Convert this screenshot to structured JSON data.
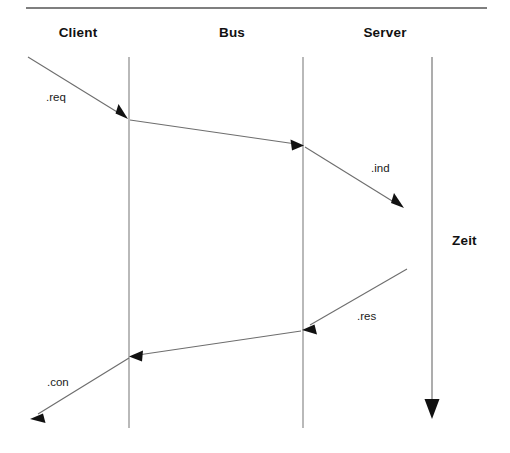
{
  "diagram": {
    "kind": "sequence-diagram",
    "width": 510,
    "height": 453,
    "background_color": "#ffffff",
    "line_color": "#6e6e6e",
    "arrow_color": "#1a1a1a",
    "text_color": "#111111",
    "rule": {
      "name": "top-rule",
      "x1": 26,
      "y1": 8,
      "x2": 487,
      "y2": 8,
      "color": "#555555"
    },
    "lanes": [
      {
        "id": "client",
        "label": "Client",
        "label_x": 78,
        "label_y": 25,
        "has_lifeline": false
      },
      {
        "id": "bus",
        "label": "Bus",
        "label_x": 232,
        "label_y": 25,
        "has_lifeline": true,
        "lifeline_x": 129,
        "lifeline_y1": 57,
        "lifeline_y2": 428
      },
      {
        "id": "server",
        "label": "Server",
        "label_x": 385,
        "label_y": 25,
        "has_lifeline": true,
        "lifeline_x": 303,
        "lifeline_y1": 57,
        "lifeline_y2": 428
      }
    ],
    "time_axis": {
      "label": "Zeit",
      "label_x": 452,
      "label_y": 233,
      "x": 432,
      "y1": 57,
      "y2": 418,
      "arrow_direction": "down"
    },
    "messages": [
      {
        "id": "req",
        "label": ".req",
        "label_x": 46,
        "label_y": 91,
        "from": "client",
        "to": "bus",
        "x1": 28,
        "y1": 57,
        "x2": 127,
        "y2": 118,
        "arrowhead": "end"
      },
      {
        "id": "bus-to-server",
        "label": "",
        "from": "bus",
        "to": "server",
        "x1": 130,
        "y1": 120,
        "x2": 301,
        "y2": 145,
        "arrowhead": "end"
      },
      {
        "id": "ind",
        "label": ".ind",
        "label_x": 371,
        "label_y": 162,
        "from": "server",
        "to": "server-end",
        "x1": 305,
        "y1": 147,
        "x2": 402,
        "y2": 207,
        "arrowhead": "end"
      },
      {
        "id": "res",
        "label": ".res",
        "label_x": 357,
        "label_y": 310,
        "from": "server-start",
        "to": "server",
        "x1": 406,
        "y1": 270,
        "x2": 305,
        "y2": 329,
        "arrowhead": "end"
      },
      {
        "id": "server-to-bus",
        "label": "",
        "from": "server",
        "to": "bus",
        "x1": 301,
        "y1": 331,
        "x2": 131,
        "y2": 356,
        "arrowhead": "end"
      },
      {
        "id": "con",
        "label": ".con",
        "label_x": 47,
        "label_y": 376,
        "from": "bus",
        "to": "client",
        "x1": 129,
        "y1": 358,
        "x2": 32,
        "y2": 418,
        "arrowhead": "end"
      }
    ]
  }
}
